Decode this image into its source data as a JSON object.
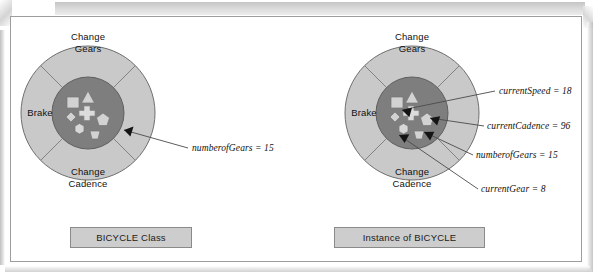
{
  "figure": {
    "title_left": "BICYCLE Class",
    "title_right": "Instance of BICYCLE"
  },
  "diagrams": [
    {
      "id": "bicycle-class",
      "caption": "BICYCLE Class",
      "center": {
        "x": 88,
        "y": 113
      },
      "outer_radius": 67,
      "inner_radius": 36,
      "ring_labels": [
        {
          "name": "change-gears",
          "text": "Change\nGears",
          "x": 88,
          "y": 38
        },
        {
          "name": "brake",
          "text": "Brake",
          "x": 39,
          "y": 112
        },
        {
          "name": "change-cadence",
          "text": "Change\nCadence",
          "x": 88,
          "y": 172
        }
      ],
      "inner_shapes": [
        {
          "name": "triangle-shape",
          "type": "triangle"
        },
        {
          "name": "square-shape",
          "type": "square"
        },
        {
          "name": "cross-shape",
          "type": "cross"
        },
        {
          "name": "diamond-shape",
          "type": "diamond"
        },
        {
          "name": "hexagon-shape",
          "type": "hexagon"
        },
        {
          "name": "pentagon-shape",
          "type": "pentagon"
        },
        {
          "name": "trapezoid-shape",
          "type": "trapezoid"
        }
      ],
      "annotations": [
        {
          "name": "annotation-numberofgears",
          "label": "numberofGears = 15",
          "label_x": 192,
          "label_y": 148
        }
      ]
    },
    {
      "id": "bicycle-instance",
      "caption": "Instance of BICYCLE",
      "center": {
        "x": 412,
        "y": 113
      },
      "outer_radius": 67,
      "inner_radius": 36,
      "ring_labels": [
        {
          "name": "change-gears",
          "text": "Change\nGears",
          "x": 412,
          "y": 38
        },
        {
          "name": "brake",
          "text": "Brake",
          "x": 363,
          "y": 112
        },
        {
          "name": "change-cadence",
          "text": "Change\nCadence",
          "x": 412,
          "y": 172
        }
      ],
      "inner_shapes": [
        {
          "name": "triangle-shape",
          "type": "triangle"
        },
        {
          "name": "square-shape",
          "type": "square"
        },
        {
          "name": "cross-shape",
          "type": "cross"
        },
        {
          "name": "diamond-shape",
          "type": "diamond"
        },
        {
          "name": "hexagon-shape",
          "type": "hexagon"
        },
        {
          "name": "pentagon-shape",
          "type": "pentagon"
        },
        {
          "name": "trapezoid-shape",
          "type": "trapezoid"
        }
      ],
      "annotations": [
        {
          "name": "annotation-currentspeed",
          "label": "currentSpeed = 18",
          "label_x": 499,
          "label_y": 92
        },
        {
          "name": "annotation-currentcadence",
          "label": "currentCadence = 96",
          "label_x": 487,
          "label_y": 127
        },
        {
          "name": "annotation-numberofgears",
          "label": "numberofGears = 15",
          "label_x": 476,
          "label_y": 156
        },
        {
          "name": "annotation-currentgear",
          "label": "currentGear = 8",
          "label_x": 481,
          "label_y": 190
        }
      ]
    }
  ],
  "colors": {
    "outer_ring": "#c9c9c9",
    "inner_circle": "#7e7e7e",
    "shape_fill": "#cfcfcf",
    "stroke": "#6d6d6d",
    "caption_fill": "#cdcdcd",
    "text": "#111111"
  }
}
